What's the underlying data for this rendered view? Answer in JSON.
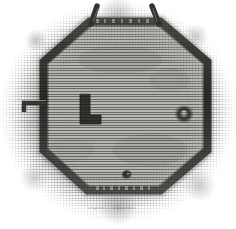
{
  "figure": {
    "medium": "wood engraving",
    "signature": "engraver signature",
    "palette": {
      "paper": "#ffffff",
      "ground_light": "#cfcfcd",
      "ground_mid": "#9a9a98",
      "interior_fill": "#b5b5b2",
      "rampart_dark": "#3b3b38",
      "rampart_shadow": "#262624",
      "mark_dark": "#2e2e2c",
      "hatch_ink": "#191919"
    }
  },
  "plan": {
    "shape_label": "octagon",
    "enclosure": {
      "name": "octagonal rampart",
      "vertices": "[(90,22),(160,22),(207,62),(207,150),(160,190),(88,190),(44,150),(44,62)]",
      "wall_width_px": 9
    },
    "features": [
      {
        "id": "top-prong-left",
        "name": "left horn spur",
        "position": "(93,12)",
        "description": "angled spur projecting up-left from top-left vertex"
      },
      {
        "id": "top-prong-right",
        "name": "right horn spur",
        "position": "(157,12)",
        "description": "angled spur projecting up-right from top-right vertex"
      },
      {
        "id": "west-spur",
        "name": "west gate spur",
        "position": "(30,106)",
        "description": "short bar projecting west from the left wall"
      },
      {
        "id": "interior-mark",
        "name": "L-shaped interior mark",
        "position": "(80,95)",
        "size": "19x28",
        "description": "dark L-shaped block inside the enclosure"
      },
      {
        "id": "east-pit",
        "name": "east circular pit",
        "position": "(184,114)",
        "radius_px": 9
      },
      {
        "id": "south-pit",
        "name": "south circular pit",
        "position": "(127,175)",
        "radius_px": 5
      }
    ]
  }
}
